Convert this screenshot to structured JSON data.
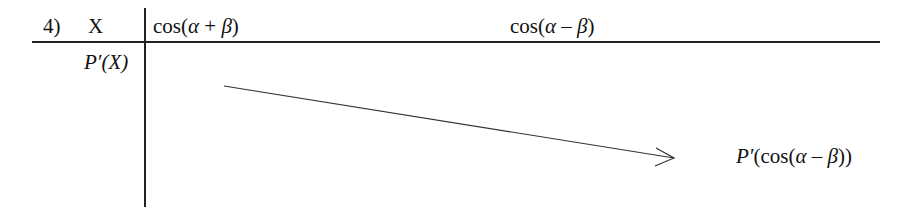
{
  "diagram": {
    "number": "4)",
    "header_variable": "X",
    "row_label": "P′(X)",
    "columns": [
      {
        "label_prefix": "cos(",
        "alpha": "α",
        "op": " + ",
        "beta": "β",
        "suffix": ")"
      },
      {
        "label_prefix": "cos(",
        "alpha": "α",
        "op": " – ",
        "beta": "β",
        "suffix": ")"
      }
    ],
    "arrow_target_label": {
      "p": "P′",
      "open": "(cos(",
      "alpha": "α",
      "op": " – ",
      "beta": "β",
      "close": "))"
    },
    "line_color": "#222222"
  }
}
